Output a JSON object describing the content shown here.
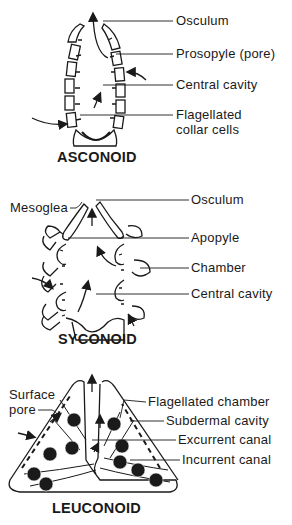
{
  "figure": {
    "panels": [
      {
        "title": "ASCONOID",
        "labels": [
          "Osculum",
          "Prosopyle (pore)",
          "Central cavity",
          "Flagellated",
          "collar cells"
        ]
      },
      {
        "title": "SYCONOID",
        "labels": [
          "Mesoglea",
          "Osculum",
          "Apopyle",
          "Chamber",
          "Central cavity"
        ]
      },
      {
        "title": "LEUCONOID",
        "labels": [
          "Surface",
          "pore",
          "Flagellated chamber",
          "Subdermal cavity",
          "Excurrent canal",
          "Incurrent canal"
        ]
      }
    ],
    "caption_fragment": ""
  },
  "colors": {
    "ink": "#1a1a1a",
    "background": "#ffffff"
  }
}
